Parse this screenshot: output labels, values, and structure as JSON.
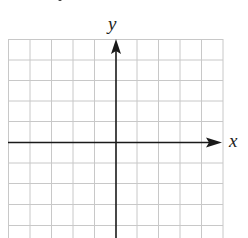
{
  "figure": {
    "type": "blank coordinate grid",
    "x_axis_label": "x",
    "y_axis_label": "y",
    "grid": {
      "columns": 10,
      "rows_visible": 9,
      "origin_column_index": 5,
      "origin_row_index": 5,
      "cropped_bottom": true
    },
    "colors": {
      "grid_line": "#c8c8c8",
      "axis": "#1a1a1a",
      "label": "#222222",
      "background": "#ffffff"
    }
  }
}
